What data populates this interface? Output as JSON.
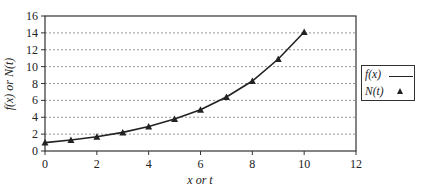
{
  "chart_data": {
    "type": "line",
    "title": "",
    "xlabel": "x or t",
    "ylabel": "f(x) or N(t)",
    "xlim": [
      0,
      12
    ],
    "ylim": [
      0,
      16
    ],
    "xticks": [
      0,
      2,
      4,
      6,
      8,
      10,
      12
    ],
    "yticks": [
      0,
      2,
      4,
      6,
      8,
      10,
      12,
      14,
      16
    ],
    "grid": {
      "horizontal": true,
      "vertical": false,
      "style": "dotted"
    },
    "legend_position": "right",
    "series": [
      {
        "name": "f(x)",
        "style": "line",
        "x": [
          0,
          1,
          2,
          3,
          4,
          5,
          6,
          7,
          8,
          9,
          10
        ],
        "values": [
          1.0,
          1.3,
          1.7,
          2.2,
          2.9,
          3.8,
          4.9,
          6.4,
          8.3,
          10.9,
          14.1
        ]
      },
      {
        "name": "N(t)",
        "style": "triangle-markers",
        "x": [
          0,
          1,
          2,
          3,
          4,
          5,
          6,
          7,
          8,
          9,
          10
        ],
        "values": [
          1.0,
          1.3,
          1.7,
          2.2,
          2.9,
          3.8,
          4.9,
          6.4,
          8.3,
          10.9,
          14.1
        ]
      }
    ]
  },
  "legend": {
    "items": [
      {
        "label": "f(x)",
        "symbol": "line"
      },
      {
        "label": "N(t)",
        "symbol": "triangle"
      }
    ]
  },
  "colors": {
    "line": "#222222",
    "grid": "#999999",
    "axis": "#333333"
  }
}
